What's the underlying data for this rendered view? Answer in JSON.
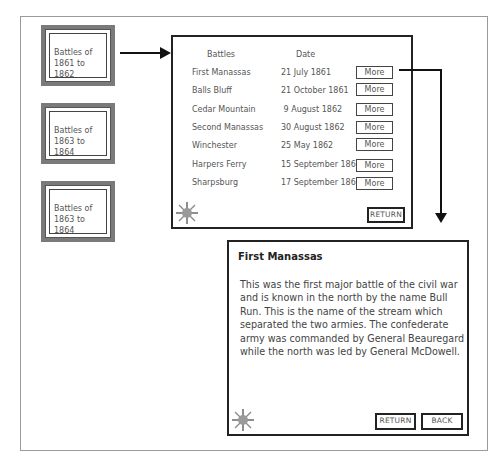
{
  "menu": {
    "items": [
      {
        "label": "Battles of 1861 to 1862"
      },
      {
        "label": "Battles of 1863 to 1864"
      },
      {
        "label": "Battles of 1863 to 1864"
      }
    ]
  },
  "battle_list": {
    "headers": {
      "battles": "Battles",
      "date": "Date"
    },
    "rows": [
      {
        "name": "First Manassas",
        "date": "21 July 1861",
        "action": "More"
      },
      {
        "name": "Balls Bluff",
        "date": "21 October 1861",
        "action": "More"
      },
      {
        "name": "Cedar Mountain",
        "date": " 9 August 1862",
        "action": "More"
      },
      {
        "name": "Second Manassas",
        "date": "30 August 1862",
        "action": "More"
      },
      {
        "name": "Winchester",
        "date": "25 May 1862",
        "action": "More"
      },
      {
        "name": "Harpers Ferry",
        "date": "15 September 1862",
        "action": "More"
      },
      {
        "name": "Sharpsburg",
        "date": "17 September 1862",
        "action": "More"
      }
    ],
    "return_label": "RETURN"
  },
  "detail": {
    "title": "First Manassas",
    "body": "This was the first major battle of the civil war and is known in the north by the name Bull Run. This is the name of the stream which separated the two armies. The confederate army was commanded by General Beauregard while the north was led by General McDowell.",
    "return_label": "RETURN",
    "back_label": "BACK"
  },
  "icons": {
    "help": "sun-icon"
  },
  "colors": {
    "frame": "#7a7a7a",
    "border": "#222222",
    "text": "#555555",
    "sun": "#9a9a9a"
  }
}
